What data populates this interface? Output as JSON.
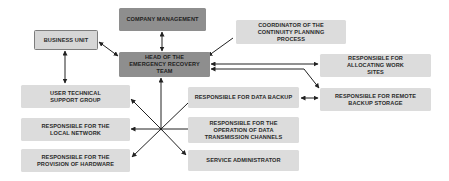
{
  "diagram": {
    "type": "organizational-structure",
    "nodes": {
      "company_management": "COMPANY MANAGEMENT",
      "head": "HEAD OF THE EMERGENCY RECOVERY TEAM",
      "business_unit": "BUSINESS UNIT",
      "coordinator": "COORDINATOR OF THE CONTINUITY PLANNING PROCESS",
      "allocating": "RESPONSIBLE FOR ALLOCATING WORK SITES",
      "remote_backup": "RESPONSIBLE FOR REMOTE BACKUP STORAGE",
      "user_support": "USER TECHNICAL SUPPORT GROUP",
      "data_backup": "RESPONSIBLE FOR DATA BACKUP",
      "local_network": "RESPONSIBLE FOR THE LOCAL NETWORK",
      "transmission": "RESPONSIBLE FOR THE OPERATION OF DATA TRANSMISSION CHANNELS",
      "hardware": "RESPONSIBLE FOR THE PROVISION OF HARDWARE",
      "service_admin": "SERVICE ADMINISTRATOR"
    },
    "edges": [
      {
        "from": "company_management",
        "to": "head",
        "direction": "both"
      },
      {
        "from": "business_unit",
        "to": "head",
        "direction": "both"
      },
      {
        "from": "coordinator",
        "to": "head",
        "direction": "to"
      },
      {
        "from": "head",
        "to": "allocating",
        "direction": "both"
      },
      {
        "from": "head",
        "to": "remote_backup",
        "direction": "both"
      },
      {
        "from": "business_unit",
        "to": "user_support",
        "direction": "both"
      },
      {
        "from": "data_backup",
        "to": "remote_backup",
        "direction": "both"
      },
      {
        "from": "hub",
        "to": "head",
        "direction": "to"
      },
      {
        "from": "hub",
        "to": "user_support",
        "direction": "to"
      },
      {
        "from": "hub",
        "to": "local_network",
        "direction": "to"
      },
      {
        "from": "hub",
        "to": "hardware",
        "direction": "to"
      },
      {
        "from": "hub",
        "to": "service_admin",
        "direction": "to"
      },
      {
        "from": "hub",
        "to": "data_backup",
        "direction": "none"
      },
      {
        "from": "hub",
        "to": "transmission",
        "direction": "none"
      }
    ]
  },
  "colors": {
    "primary_box": "#8e8e8e",
    "secondary_box": "#dcdcdc",
    "outline": "#7d7d7d",
    "line": "#222222"
  }
}
